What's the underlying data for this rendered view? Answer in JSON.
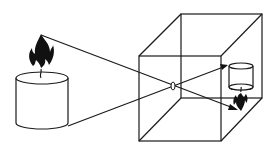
{
  "diagram": {
    "type": "pinhole-camera",
    "elements": [
      {
        "name": "candle-object",
        "description": "Upright lit candle (cylinder with flame)"
      },
      {
        "name": "camera-box",
        "description": "Wireframe cube representing camera obscura"
      },
      {
        "name": "pinhole",
        "description": "Small aperture on front face of box"
      },
      {
        "name": "light-ray-top",
        "description": "Ray from flame tip through pinhole to bottom of back wall"
      },
      {
        "name": "light-ray-bottom",
        "description": "Ray from candle base through pinhole to top of back wall"
      },
      {
        "name": "inverted-image",
        "description": "Upside-down candle image projected on back wall"
      }
    ],
    "colors": {
      "stroke": "#1a1a1a",
      "flame": "#111111",
      "background": "#ffffff"
    }
  }
}
